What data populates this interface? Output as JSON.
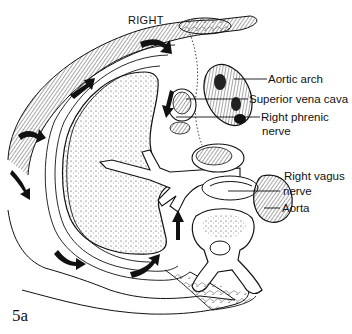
{
  "figure": {
    "orientation_label": "RIGHT",
    "figure_number": "5a",
    "labels": [
      {
        "id": "aortic-arch",
        "text": "Aortic arch"
      },
      {
        "id": "superior-vena-cava",
        "text": "Superior vena cava"
      },
      {
        "id": "right-phrenic-nerve",
        "text": "Right phrenic",
        "text2": "nerve"
      },
      {
        "id": "right-vagus-nerve",
        "text": "Right vagus",
        "text2": "nerve"
      },
      {
        "id": "aorta",
        "text": "Aorta"
      }
    ],
    "colors": {
      "ink": "#111111",
      "background": "#ffffff"
    }
  }
}
